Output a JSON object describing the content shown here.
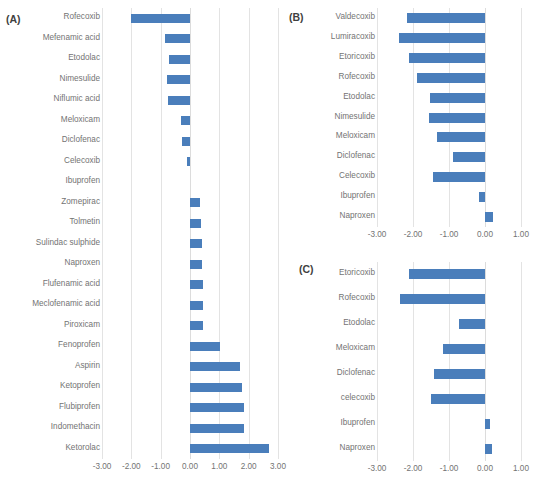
{
  "chart_data": [
    {
      "type": "bar",
      "orientation": "horizontal",
      "panel": "(A)",
      "title": "",
      "xlabel": "",
      "ylabel": "",
      "xlim": [
        -3.0,
        3.0
      ],
      "xticks": [
        "-3.00",
        "-2.00",
        "-1.00",
        "0.00",
        "1.00",
        "2.00",
        "3.00"
      ],
      "xtick_values": [
        -3,
        -2,
        -1,
        0,
        1,
        2,
        3
      ],
      "grid": true,
      "legend": "none",
      "bar_color": "#4a7ebb",
      "categories": [
        "Rofecoxib",
        "Mefenamic acid",
        "Etodolac",
        "Nimesulide",
        "Niflumic acid",
        "Meloxicam",
        "Diclofenac",
        "Celecoxib",
        "Ibuprofen",
        "Zomepirac",
        "Tolmetin",
        "Sulindac sulphide",
        "Naproxen",
        "Flufenamic acid",
        "Meclofenamic acid",
        "Piroxicam",
        "Fenoprofen",
        "Aspirin",
        "Ketoprofen",
        "Flubiprofen",
        "Indomethacin",
        "Ketorolac"
      ],
      "values": [
        -2.0,
        -0.85,
        -0.72,
        -0.78,
        -0.76,
        -0.3,
        -0.28,
        -0.11,
        0.0,
        0.33,
        0.38,
        0.4,
        0.4,
        0.43,
        0.44,
        0.46,
        1.02,
        1.72,
        1.76,
        1.83,
        1.85,
        2.68
      ]
    },
    {
      "type": "bar",
      "orientation": "horizontal",
      "panel": "(B)",
      "title": "",
      "xlabel": "",
      "ylabel": "",
      "xlim": [
        -3.0,
        1.0
      ],
      "xticks": [
        "-3.00",
        "-2.00",
        "-1.00",
        "0.00",
        "1.00"
      ],
      "xtick_values": [
        -3,
        -2,
        -1,
        0,
        1
      ],
      "grid": true,
      "legend": "none",
      "bar_color": "#4a7ebb",
      "categories": [
        "Valdecoxib",
        "Lumiracoxib",
        "Etoricoxib",
        "Rofecoxib",
        "Etodolac",
        "Nimesulide",
        "Meloxicam",
        "Diclofenac",
        "Celecoxib",
        "Ibuprofen",
        "Naproxen"
      ],
      "values": [
        -2.16,
        -2.4,
        -2.12,
        -1.9,
        -1.53,
        -1.56,
        -1.33,
        -0.88,
        -1.45,
        -0.17,
        0.22
      ]
    },
    {
      "type": "bar",
      "orientation": "horizontal",
      "panel": "(C)",
      "title": "",
      "xlabel": "",
      "ylabel": "",
      "xlim": [
        -3.0,
        1.0
      ],
      "xticks": [
        "-3.00",
        "-2.00",
        "-1.00",
        "0.00",
        "1.00"
      ],
      "xtick_values": [
        -3,
        -2,
        -1,
        0,
        1
      ],
      "grid": true,
      "legend": "none",
      "bar_color": "#4a7ebb",
      "categories": [
        "Etoricoxib",
        "Rofecoxib",
        "Etodolac",
        "Meloxicam",
        "Diclofenac",
        "celecoxib",
        "Ibuprofen",
        "Naproxen"
      ],
      "values": [
        -2.1,
        -2.36,
        -0.72,
        -1.17,
        -1.43,
        -1.5,
        0.14,
        0.2
      ]
    }
  ]
}
